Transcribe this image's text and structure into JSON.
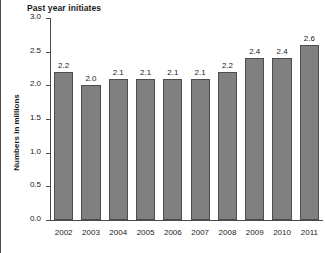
{
  "chart_data": {
    "type": "bar",
    "title": "Past year initiates",
    "xlabel": "",
    "ylabel": "Numbers in millions",
    "categories": [
      "2002",
      "2003",
      "2004",
      "2005",
      "2006",
      "2007",
      "2008",
      "2009",
      "2010",
      "2011"
    ],
    "values": [
      2.2,
      2.0,
      2.1,
      2.1,
      2.1,
      2.1,
      2.2,
      2.4,
      2.4,
      2.6
    ],
    "value_labels": [
      "2.2",
      "2.0",
      "2.1",
      "2.1",
      "2.1",
      "2.1",
      "2.2",
      "2.4",
      "2.4",
      "2.6"
    ],
    "ylim": [
      0.0,
      3.0
    ],
    "ytick_labels": [
      "0.0",
      "0.5",
      "1.0",
      "1.5",
      "2.0",
      "2.5",
      "3.0"
    ],
    "ytick_values": [
      0.0,
      0.5,
      1.0,
      1.5,
      2.0,
      2.5,
      3.0
    ],
    "grid": false,
    "legend": null,
    "bar_color": "#808080",
    "bar_edge_color": "#4d4d4d",
    "axis_color": "#4a4a4a",
    "text_color": "#1a1a1a",
    "background": "#ffffff"
  }
}
